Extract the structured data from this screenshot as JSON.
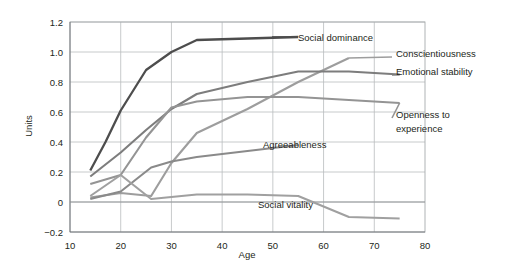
{
  "chart_data": {
    "type": "line",
    "title": "",
    "xlabel": "Age",
    "ylabel": "Units",
    "xlim": [
      10,
      80
    ],
    "ylim": [
      -0.2,
      1.2
    ],
    "xticks": [
      10,
      20,
      30,
      40,
      50,
      60,
      70,
      80
    ],
    "xtick_labels": [
      "10",
      "20",
      "30",
      "40",
      "50",
      "60",
      "70",
      "80"
    ],
    "yticks": [
      -0.2,
      0,
      0.2,
      0.4,
      0.6,
      0.8,
      1.0,
      1.2
    ],
    "ytick_labels": [
      "−0.2",
      "0",
      "0.2",
      "0.4",
      "0.6",
      "0.8",
      "1.0",
      "1.2"
    ],
    "grid": true,
    "grid_axis": "both",
    "legend": "inline-annotations",
    "series": [
      {
        "name": "Social dominance",
        "color": "#4d4d4d",
        "width": 2.3,
        "label_x": 57,
        "label_y": 1.12,
        "x": [
          14,
          17,
          20,
          25,
          30,
          35,
          45,
          55
        ],
        "y": [
          0.21,
          0.4,
          0.61,
          0.88,
          1.0,
          1.08,
          1.09,
          1.1
        ]
      },
      {
        "name": "Conscientiousness",
        "color": "#9d9d9d",
        "width": 2.1,
        "label_x": 75,
        "label_y": 1.0,
        "x": [
          14,
          20,
          26,
          30,
          35,
          45,
          55,
          65
        ],
        "y": [
          0.03,
          0.06,
          0.04,
          0.26,
          0.46,
          0.62,
          0.8,
          0.96
        ]
      },
      {
        "name": "Emotional stability",
        "color": "#7d7d7d",
        "width": 2.1,
        "label_x": 75,
        "label_y": 0.88,
        "x": [
          14,
          20,
          25,
          30,
          35,
          45,
          55,
          65,
          75
        ],
        "y": [
          0.17,
          0.33,
          0.48,
          0.62,
          0.72,
          0.8,
          0.87,
          0.87,
          0.85
        ]
      },
      {
        "name": "Openness to experience",
        "color": "#949494",
        "width": 2.1,
        "label_x": 75,
        "label_y": 0.56,
        "label_line2": "experience",
        "x": [
          14,
          20,
          25,
          30,
          35,
          45,
          55,
          65,
          75
        ],
        "y": [
          0.12,
          0.18,
          0.43,
          0.63,
          0.67,
          0.7,
          0.7,
          0.68,
          0.66
        ]
      },
      {
        "name": "Agreeableness",
        "color": "#8a8a8a",
        "width": 2.1,
        "label_x": 40,
        "label_y": 0.37,
        "x": [
          14,
          20,
          26,
          30,
          35,
          45,
          55
        ],
        "y": [
          0.02,
          0.07,
          0.23,
          0.27,
          0.3,
          0.34,
          0.38
        ]
      },
      {
        "name": "Social vitality",
        "color": "#a0a0a0",
        "width": 2.1,
        "label_x": 40,
        "label_y": 0.03,
        "x": [
          14,
          20,
          26,
          35,
          45,
          55,
          65,
          75
        ],
        "y": [
          0.04,
          0.18,
          0.02,
          0.05,
          0.05,
          0.04,
          -0.1,
          -0.11
        ]
      }
    ],
    "annotations": [
      {
        "text": "Social dominance",
        "series": "Social dominance"
      },
      {
        "text": "Conscientiousness",
        "series": "Conscientiousness"
      },
      {
        "text": "Emotional stability",
        "series": "Emotional stability"
      },
      {
        "text": "Openness to",
        "series": "Openness to experience"
      },
      {
        "text": "experience",
        "series": "Openness to experience"
      },
      {
        "text": "Agreeableness",
        "series": "Agreeableness"
      },
      {
        "text": "Social vitality",
        "series": "Social vitality"
      }
    ]
  },
  "colors": {
    "background": "#ffffff",
    "grid": "#b9bcbe",
    "axis": "#6e7376",
    "text": "#231f20"
  }
}
